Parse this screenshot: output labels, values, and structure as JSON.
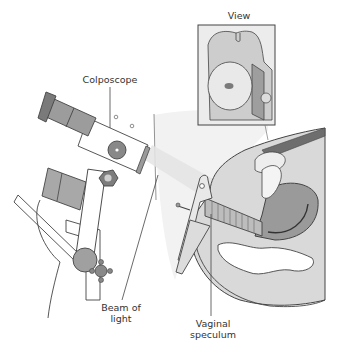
{
  "figure": {
    "type": "medical-illustration"
  },
  "labels": {
    "view": "View",
    "colposcope": "Colposcope",
    "beam_line1": "Beam of",
    "beam_line2": "light",
    "speculum_line1": "Vaginal",
    "speculum_line2": "speculum"
  },
  "colors": {
    "outline": "#444444",
    "tissue_light": "#d6d6d6",
    "tissue_mid": "#b3b3b3",
    "tissue_dark": "#8a8a8a",
    "background": "#ffffff",
    "beam": "#e6e6e6"
  }
}
